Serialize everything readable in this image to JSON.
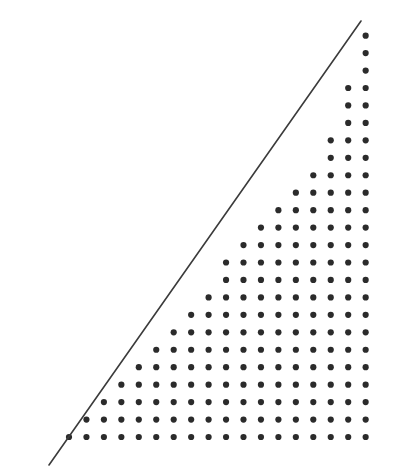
{
  "figure": {
    "title": "Lattice points bounded by a line",
    "background_color": "#ffffff",
    "width": 408,
    "height": 468
  },
  "chart_data": {
    "type": "scatter",
    "title": "",
    "subtitle": "",
    "xlabel": "",
    "ylabel": "",
    "xlim": [
      0,
      408
    ],
    "ylim": [
      0,
      468
    ],
    "grid": false,
    "legend": null,
    "annotations": [],
    "axes_visible": false,
    "tick_labels_x": [],
    "tick_labels_y": [],
    "lattice": {
      "marker": "circle",
      "marker_color": "#2b2b2b",
      "marker_diameter_px": 6.2,
      "column_spacing_px": 17.45,
      "row_spacing_px": 17.45,
      "first_column_x_px": 69,
      "bottom_row_y_px": 437,
      "n_columns": 18,
      "n_rows": 24,
      "row_start_column_index": [
        0,
        1,
        2,
        3,
        4,
        5,
        6,
        7,
        8,
        9,
        9,
        10,
        11,
        12,
        13,
        14,
        15,
        15,
        16,
        16,
        16,
        17,
        17,
        17
      ],
      "row_counts_from_bottom": [
        18,
        17,
        16,
        15,
        14,
        13,
        12,
        11,
        10,
        9,
        9,
        8,
        7,
        6,
        5,
        4,
        3,
        3,
        2,
        2,
        2,
        1,
        1,
        1
      ],
      "total_dots": 202
    },
    "line": {
      "name": "boundary-line",
      "color": "#3b3b3b",
      "width_px": 1.6,
      "x0_px": 49,
      "y0_px": 465,
      "x1_px": 361,
      "y1_px": 21,
      "slope_px_per_px": -1.423,
      "style": "solid"
    }
  }
}
